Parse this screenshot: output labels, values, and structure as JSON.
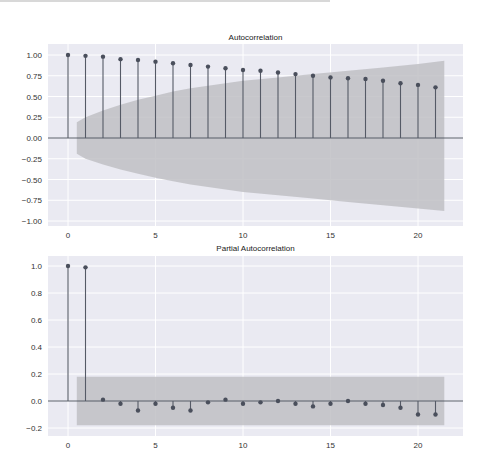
{
  "chart_data": [
    {
      "type": "stem",
      "title": "Autocorrelation",
      "xlabel": "",
      "ylabel": "",
      "xlim": [
        -1.5,
        22.5
      ],
      "ylim": [
        -1.05,
        1.1
      ],
      "xticks": [
        0,
        5,
        10,
        15,
        20
      ],
      "yticks": [
        1.0,
        0.75,
        0.5,
        0.25,
        0.0,
        -0.25,
        -0.5,
        -0.75,
        -1.0
      ],
      "ytick_labels": [
        "1.00",
        "0.75",
        "0.50",
        "0.25",
        "0.00",
        "−0.25",
        "−0.50",
        "−0.75",
        "−1.00"
      ],
      "grid": true,
      "lags": [
        0,
        1,
        2,
        3,
        4,
        5,
        6,
        7,
        8,
        9,
        10,
        11,
        12,
        13,
        14,
        15,
        16,
        17,
        18,
        19,
        20,
        21
      ],
      "values": [
        1.0,
        0.99,
        0.98,
        0.95,
        0.94,
        0.92,
        0.9,
        0.88,
        0.86,
        0.84,
        0.82,
        0.81,
        0.79,
        0.77,
        0.75,
        0.73,
        0.72,
        0.71,
        0.69,
        0.66,
        0.64,
        0.61
      ],
      "confidence_band": {
        "x": [
          0.5,
          1,
          2,
          3,
          4,
          5,
          6,
          7,
          8,
          9,
          10,
          12,
          14,
          16,
          18,
          20,
          21.5
        ],
        "upper": [
          0.19,
          0.25,
          0.33,
          0.4,
          0.46,
          0.51,
          0.56,
          0.6,
          0.63,
          0.66,
          0.69,
          0.73,
          0.77,
          0.81,
          0.85,
          0.89,
          0.93
        ],
        "lower": [
          -0.19,
          -0.25,
          -0.32,
          -0.38,
          -0.43,
          -0.48,
          -0.52,
          -0.56,
          -0.59,
          -0.62,
          -0.65,
          -0.69,
          -0.73,
          -0.77,
          -0.81,
          -0.85,
          -0.88
        ]
      }
    },
    {
      "type": "stem",
      "title": "Partial Autocorrelation",
      "xlabel": "",
      "ylabel": "",
      "xlim": [
        -1.5,
        22.5
      ],
      "ylim": [
        -0.26,
        1.07
      ],
      "xticks": [
        0,
        5,
        10,
        15,
        20
      ],
      "yticks": [
        1.0,
        0.8,
        0.6,
        0.4,
        0.2,
        0.0,
        -0.2
      ],
      "ytick_labels": [
        "1.0",
        "0.8",
        "0.6",
        "0.4",
        "0.2",
        "0.0",
        "−0.2"
      ],
      "grid": true,
      "lags": [
        0,
        1,
        2,
        3,
        4,
        5,
        6,
        7,
        8,
        9,
        10,
        11,
        12,
        13,
        14,
        15,
        16,
        17,
        18,
        19,
        20,
        21
      ],
      "values": [
        1.0,
        0.99,
        0.01,
        -0.02,
        -0.07,
        -0.02,
        -0.05,
        -0.07,
        -0.01,
        0.01,
        -0.02,
        -0.01,
        0.0,
        -0.02,
        -0.04,
        -0.02,
        0.0,
        -0.02,
        -0.03,
        -0.05,
        -0.1,
        -0.1
      ],
      "confidence_band": {
        "x": [
          0.5,
          21.5
        ],
        "upper": [
          0.18,
          0.18
        ],
        "lower": [
          -0.18,
          -0.18
        ]
      }
    }
  ],
  "colors": {
    "plot_bg": "#eaeaf2",
    "grid": "#ffffff",
    "band": "#c0c0c4",
    "stem": "#555a66",
    "marker": "#4a4f5c",
    "zero_line": "#555a66"
  }
}
